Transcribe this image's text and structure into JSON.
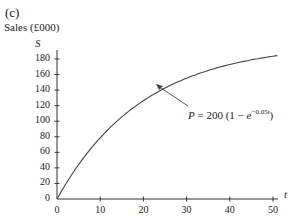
{
  "panel_label": "(c)",
  "y_axis_title": "Sales (£000)",
  "y_symbol": "S",
  "x_symbol": "t",
  "annotation": {
    "P": "P",
    "eq": " = 200 (1 − ",
    "e": "e",
    "exp": "−0.05t",
    "close": ")"
  },
  "chart_data": {
    "type": "line",
    "title": "(c)",
    "xlabel": "t",
    "ylabel": "Sales (£000) S",
    "xlim": [
      0,
      52
    ],
    "ylim": [
      0,
      180
    ],
    "x_ticks": [
      0,
      10,
      20,
      30,
      40,
      50
    ],
    "y_ticks": [
      0,
      20,
      40,
      60,
      80,
      100,
      120,
      140,
      160,
      180
    ],
    "grid": false,
    "legend": null,
    "annotations": [
      "P = 200 (1 − e^(−0.05t))"
    ],
    "values_source": "Computed from the labeled formula P = 200(1 − e^(−0.05t)); endpoint (t≈51, S≈183) was measured from the plot and agrees with the formula. Intermediate points were not individually read off the pixels.",
    "series": [
      {
        "name": "P = 200 (1 − e^(−0.05t))",
        "x": [
          0,
          5,
          10,
          15,
          20,
          25,
          30,
          35,
          40,
          45,
          50,
          51
        ],
        "values": [
          0,
          44.2,
          78.7,
          105.5,
          126.4,
          142.7,
          155.4,
          165.2,
          172.9,
          178.9,
          183.6,
          184.4
        ]
      }
    ]
  }
}
